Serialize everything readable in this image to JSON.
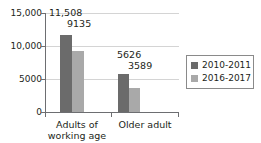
{
  "chart_data": {
    "type": "bar",
    "title": "",
    "subtitle": "",
    "xlabel": "",
    "ylabel": "",
    "categories": [
      "Adults of working age",
      "Older adult"
    ],
    "category_lines": [
      [
        "Adults of",
        "working age"
      ],
      [
        "Older adult",
        ""
      ]
    ],
    "series": [
      {
        "name": "2010-2011",
        "color": "#6b6b6b",
        "values": [
          11508,
          5626
        ],
        "value_labels": [
          "11,508",
          "5626"
        ]
      },
      {
        "name": "2016-2017",
        "color": "#a9a9a9",
        "values": [
          9135,
          3589
        ],
        "value_labels": [
          "9135",
          "3589"
        ]
      }
    ],
    "ylim": [
      0,
      15000
    ],
    "yticks": [
      0,
      5000,
      10000,
      15000
    ],
    "ytick_labels": [
      "0",
      "5000",
      "10,000",
      "15,000"
    ],
    "grid": true,
    "grid_axis": "y",
    "legend_position": "right"
  },
  "axis": {
    "y": {
      "t15000": "15,000",
      "t10000": "10,000",
      "t5000": "5000",
      "t0": "0"
    }
  },
  "labels": {
    "v0": "11,508",
    "v1": "9135",
    "v2": "5626",
    "v3": "3589",
    "cat0_line1": "Adults of",
    "cat0_line2": "working age",
    "cat1_line1": "Older adult"
  },
  "legend": {
    "items": [
      {
        "label": "2010-2011",
        "color": "#6b6b6b"
      },
      {
        "label": "2016-2017",
        "color": "#a9a9a9"
      }
    ]
  },
  "colors": {
    "series_1": "#6b6b6b",
    "series_2": "#a9a9a9",
    "axis": "#6d6e71",
    "grid": "#d4d4d4",
    "text": "#231f20",
    "background": "#ffffff"
  }
}
